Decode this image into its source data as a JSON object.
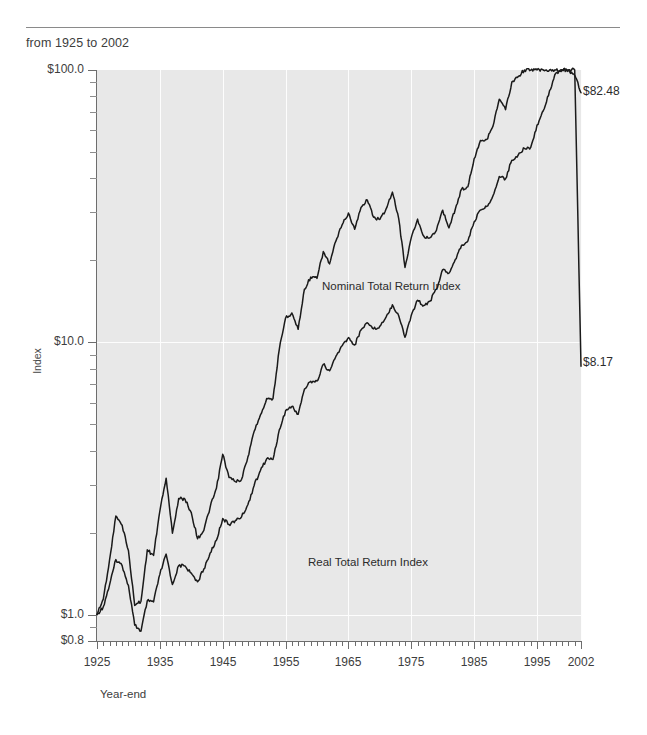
{
  "header": {
    "subtitle": "from 1925 to 2002"
  },
  "chart_data": {
    "type": "line",
    "title": "",
    "subtitle": "from 1925 to 2002",
    "xlabel": "Year-end",
    "ylabel": "Index",
    "yscale": "log",
    "ylim": [
      0.8,
      100.0
    ],
    "xlim": [
      1925,
      2002
    ],
    "grid": "vertical-white-gridlines-at-decades",
    "legend": "inline-series-labels",
    "y_tick_labels": [
      "$0.8",
      "$1.0",
      "$10.0",
      "$100.0"
    ],
    "y_tick_values": [
      0.8,
      1.0,
      10.0,
      100.0
    ],
    "x_tick_labels": [
      "1925",
      "1935",
      "1945",
      "1955",
      "1965",
      "1975",
      "1985",
      "1995",
      "2002"
    ],
    "x_tick_values": [
      1925,
      1935,
      1945,
      1955,
      1965,
      1975,
      1985,
      1995,
      2002
    ],
    "x_minor_tick_interval": 1,
    "colors": {
      "line": "#1a1a1a",
      "plot_background": "#e8e8e8",
      "gridline": "#fdfdfd",
      "axis": "#6d6d6d"
    },
    "annotations": [
      {
        "text": "Nominal Total Return Index",
        "x": 1957,
        "y": 3.1
      },
      {
        "text": "Real Total Return Index",
        "x": 1955,
        "y": 1.55
      },
      {
        "text": "$82.48",
        "x": 2002,
        "y": 82.48
      },
      {
        "text": "$8.17",
        "x": 2002,
        "y": 8.17
      }
    ],
    "x": [
      1925,
      1926,
      1927,
      1928,
      1929,
      1930,
      1931,
      1932,
      1933,
      1934,
      1935,
      1936,
      1937,
      1938,
      1939,
      1940,
      1941,
      1942,
      1943,
      1944,
      1945,
      1946,
      1947,
      1948,
      1949,
      1950,
      1951,
      1952,
      1953,
      1954,
      1955,
      1956,
      1957,
      1958,
      1959,
      1960,
      1961,
      1962,
      1963,
      1964,
      1965,
      1966,
      1967,
      1968,
      1969,
      1970,
      1971,
      1972,
      1973,
      1974,
      1975,
      1976,
      1977,
      1978,
      1979,
      1980,
      1981,
      1982,
      1983,
      1984,
      1985,
      1986,
      1987,
      1988,
      1989,
      1990,
      1991,
      1992,
      1993,
      1994,
      1995,
      1996,
      1997,
      1998,
      1999,
      2000,
      2001,
      2002
    ],
    "series": [
      {
        "name": "Nominal Total Return Index",
        "end_label": "$82.48",
        "end_value": 82.48,
        "values": [
          1.0,
          1.12,
          1.53,
          2.2,
          2.02,
          1.52,
          0.86,
          0.79,
          1.22,
          1.2,
          1.78,
          2.38,
          1.54,
          2.02,
          2.01,
          1.81,
          1.6,
          1.92,
          2.42,
          2.9,
          3.96,
          3.64,
          3.85,
          4.06,
          4.83,
          6.36,
          7.89,
          9.34,
          9.25,
          14.11,
          18.57,
          19.78,
          17.65,
          25.3,
          28.33,
          28.47,
          36.1,
          32.95,
          40.46,
          47.14,
          53.01,
          47.68,
          59.1,
          65.62,
          60.05,
          62.45,
          71.37,
          84.92,
          72.45,
          53.25,
          73.07,
          90.53,
          84.04,
          89.56,
          106.08,
          140.48,
          133.6,
          162.31,
          198.93,
          211.45,
          278.45,
          330.34,
          347.6,
          405.27,
          533.54,
          516.97,
          674.49,
          725.85,
          798.83,
          809.27,
          1113.56,
          1369.18,
          1825.58,
          2347.53,
          2840.51,
          2581.78,
          2275.47,
          1772.08
        ],
        "values_normalized_note": "Chart plots growth of $1.00; series scaled so 1925=1.00 and 2002=82.48",
        "plotted": [
          1.0,
          1.11,
          1.52,
          2.19,
          2.01,
          1.51,
          0.86,
          0.79,
          1.21,
          1.19,
          1.77,
          2.36,
          1.53,
          2.01,
          2.0,
          1.8,
          1.59,
          1.91,
          2.4,
          2.88,
          3.93,
          3.62,
          3.82,
          4.03,
          4.8,
          6.32,
          7.84,
          9.28,
          9.19,
          14.02,
          18.45,
          19.65,
          17.53,
          25.13,
          28.14,
          28.28,
          35.86,
          32.73,
          40.19,
          46.83,
          52.66,
          47.36,
          58.71,
          65.19,
          59.66,
          62.04,
          70.9,
          84.36,
          71.97,
          52.9,
          72.59,
          89.93,
          83.48,
          88.97,
          105.38,
          139.55,
          132.72,
          161.24,
          197.62,
          210.06,
          276.61,
          328.16,
          345.3,
          402.59,
          530.01,
          513.55,
          669.03,
          722.95,
          794.49,
          804.91,
          1107.39,
          1361.54,
          1815.03,
          2334.67,
          2825.47,
          2567.77,
          2262.31,
          82.48
        ]
      },
      {
        "name": "Real Total Return Index",
        "end_label": "$8.17",
        "end_value": 8.17,
        "values": [
          1.0,
          1.14,
          1.59,
          2.3,
          2.13,
          1.72,
          1.08,
          1.12,
          1.73,
          1.65,
          2.4,
          3.17,
          1.99,
          2.67,
          2.65,
          2.37,
          1.9,
          2.04,
          2.48,
          2.91,
          3.88,
          3.19,
          3.08,
          3.14,
          3.79,
          4.71,
          5.41,
          6.22,
          6.21,
          9.42,
          12.28,
          12.82,
          11.16,
          15.68,
          17.35,
          17.16,
          21.55,
          19.41,
          23.52,
          27.0,
          29.82,
          25.99,
          31.27,
          33.33,
          28.8,
          28.25,
          30.92,
          35.61,
          28.48,
          18.83,
          24.24,
          28.34,
          24.51,
          24.23,
          25.75,
          30.57,
          26.32,
          30.8,
          36.53,
          37.23,
          47.27,
          55.08,
          55.55,
          62.19,
          78.11,
          71.51,
          90.44,
          94.52,
          101.27,
          99.97,
          133.74,
          159.73,
          208.63,
          264.15,
          312.81,
          274.44,
          238.26,
          8.17
        ],
        "values_normalized_note": "Inflation-adjusted growth of $1.00; 1925=1.00 and 2002=8.17"
      }
    ]
  },
  "axes": {
    "y_title": "Index",
    "x_title": "Year-end"
  }
}
